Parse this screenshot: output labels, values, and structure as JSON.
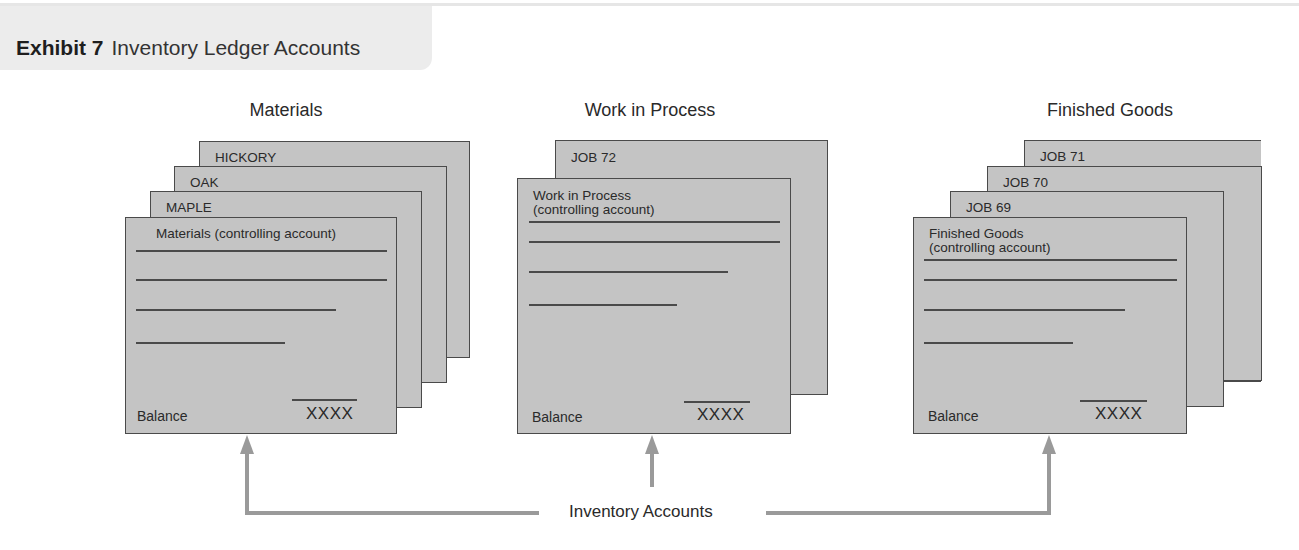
{
  "header": {
    "exhibit_number": "Exhibit 7",
    "title": "Inventory Ledger Accounts"
  },
  "colors": {
    "card_fill": "#c4c4c4",
    "card_border": "#4a4a4a",
    "arrow": "#9a9a9a",
    "header_band": "#ececec"
  },
  "groups": [
    {
      "title": "Materials",
      "subsidiary_cards": [
        "HICKORY",
        "OAK",
        "MAPLE"
      ],
      "controlling_card": {
        "label_line1": "Materials (controlling account)",
        "label_line2": "",
        "balance_label": "Balance",
        "balance_value": "XXXX"
      }
    },
    {
      "title": "Work in Process",
      "subsidiary_cards": [
        "JOB 72"
      ],
      "controlling_card": {
        "label_line1": "Work in Process",
        "label_line2": "(controlling account)",
        "balance_label": "Balance",
        "balance_value": "XXXX"
      }
    },
    {
      "title": "Finished Goods",
      "subsidiary_cards": [
        "JOB 71",
        "JOB 70",
        "JOB 69"
      ],
      "controlling_card": {
        "label_line1": "Finished Goods",
        "label_line2": "(controlling account)",
        "balance_label": "Balance",
        "balance_value": "XXXX"
      }
    }
  ],
  "connector": {
    "label": "Inventory Accounts"
  }
}
